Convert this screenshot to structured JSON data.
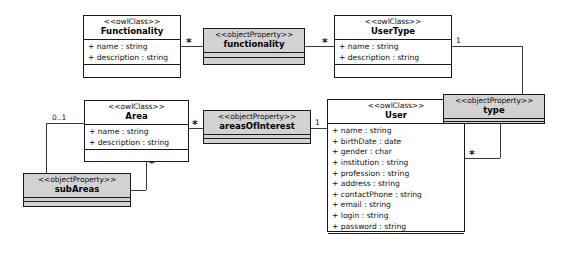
{
  "diagram": {
    "accent_class_fill": "#ffffff",
    "accent_property_fill": "#d2d2d2",
    "line_color": "#3a3a3a",
    "border_color": "#1a1a1a"
  },
  "classes": {
    "functionality": {
      "stereotype": "<<owlClass>>",
      "name": "Functionality",
      "attributes": [
        "+ name : string",
        "+ description : string"
      ]
    },
    "usertype": {
      "stereotype": "<<owlClass>>",
      "name": "UserType",
      "attributes": [
        "+ name : string",
        "+ description : string"
      ]
    },
    "area": {
      "stereotype": "<<owlClass>>",
      "name": "Area",
      "attributes": [
        "+ name : string",
        "+ description : string"
      ]
    },
    "user": {
      "stereotype": "<<owlClass>>",
      "name": "User",
      "attributes": [
        "+ name : string",
        "+ birthDate : date",
        "+ gender : char",
        "+ institution : string",
        "+ profession : string",
        "+ address : string",
        "+ contactPhone : string",
        "+ email : string",
        "+ login : string",
        "+ password : string"
      ]
    }
  },
  "properties": {
    "functionality": {
      "stereotype": "<<objectProperty>>",
      "name": "functionality"
    },
    "type": {
      "stereotype": "<<objectProperty>>",
      "name": "type"
    },
    "areasOfInterest": {
      "stereotype": "<<objectProperty>>",
      "name": "areasOfInterest"
    },
    "subAreas": {
      "stereotype": "<<objectProperty>>",
      "name": "subAreas"
    }
  },
  "multiplicities": {
    "functionality_right": "*",
    "functionality_prop_right": "*",
    "usertype_right": "1",
    "type_to_user": "*",
    "area_left": "0..1",
    "area_right": "*",
    "area_bottom_right": "*",
    "areasofinterest_right": "1"
  }
}
